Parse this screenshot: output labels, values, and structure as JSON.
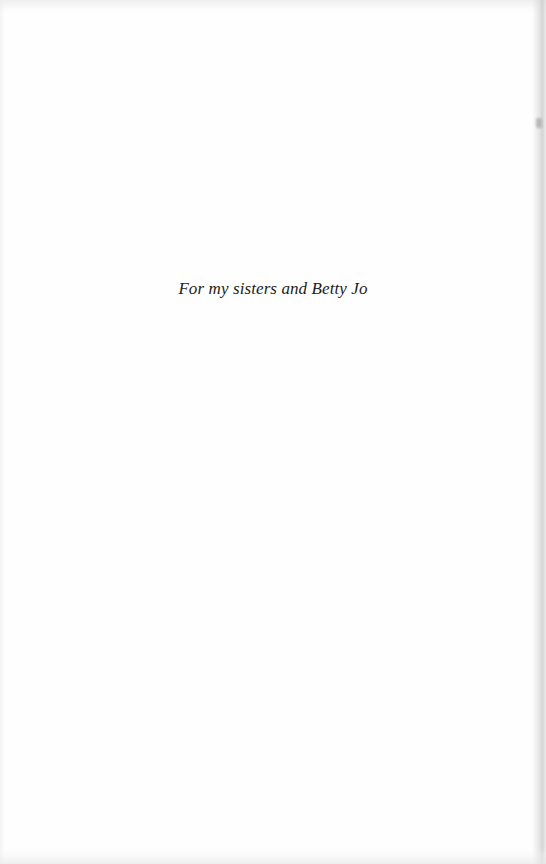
{
  "page": {
    "type": "dedication",
    "background_color": "#fefefe",
    "text_color": "#1c1c1c"
  },
  "dedication": {
    "text": "For my sisters and Betty Jo"
  }
}
